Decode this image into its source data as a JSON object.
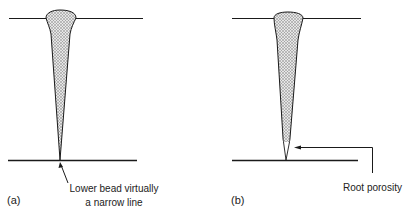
{
  "figure": {
    "panel_a": {
      "tag": "(a)",
      "annotation_line1": "Lower bead virtually",
      "annotation_line2": "a narrow line"
    },
    "panel_b": {
      "tag": "(b)",
      "annotation": "Root porosity"
    },
    "colors": {
      "line": "#1a1a1a",
      "fill": "#bfbfbf",
      "background": "#ffffff"
    }
  }
}
